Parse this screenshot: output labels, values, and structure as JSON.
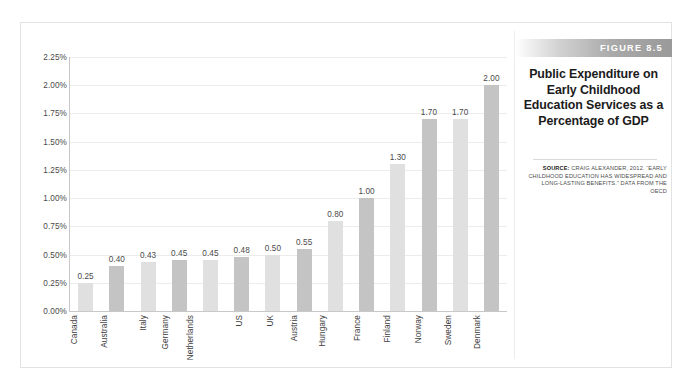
{
  "figure": {
    "band_label": "FIGURE 8.5",
    "title": "Public Expenditure on Early Childhood Education Services as a Percentage of GDP",
    "source_label": "SOURCE:",
    "source_text": "CRAIG ALEXANDER, 2012. “EARLY CHILDHOOD EDUCATION HAS WIDESPREAD AND LONG-LASTING BENEFITS.” DATA FROM THE OECD"
  },
  "colors": {
    "bar_light": "#e0e0e0",
    "bar_dark": "#c4c4c4",
    "gridline": "#ececec",
    "axis": "#c8c8c8",
    "band_start": "#ffffff",
    "band_end": "#9a9a9a",
    "text": "#4a4a4a"
  },
  "chart_data": {
    "type": "bar",
    "title": "Public Expenditure on Early Childhood Education Services as a Percentage of GDP",
    "xlabel": "",
    "ylabel": "",
    "ylim": [
      0,
      2.25
    ],
    "grid": true,
    "legend": "none",
    "ytick_labels": [
      "2.25%",
      "2.00%",
      "1.75%",
      "1.50%",
      "1.25%",
      "1.00%",
      "0.75%",
      "0.50%",
      "0.25%",
      "0.00%"
    ],
    "ytick_values": [
      2.25,
      2.0,
      1.75,
      1.5,
      1.25,
      1.0,
      0.75,
      0.5,
      0.25,
      0.0
    ],
    "categories": [
      "Canada",
      "Australia",
      "Italy",
      "Germany",
      "Netherlands",
      "US",
      "UK",
      "Austria",
      "Hungary",
      "France",
      "Finland",
      "Norway",
      "Sweden",
      "Denmark"
    ],
    "values": [
      0.25,
      0.4,
      0.43,
      0.45,
      0.45,
      0.48,
      0.5,
      0.55,
      0.8,
      1.0,
      1.3,
      1.7,
      1.7,
      2.0
    ],
    "value_labels": [
      "0.25",
      "0.40",
      "0.43",
      "0.45",
      "0.45",
      "0.48",
      "0.50",
      "0.55",
      "0.80",
      "1.00",
      "1.30",
      "1.70",
      "1.70",
      "2.00"
    ]
  }
}
